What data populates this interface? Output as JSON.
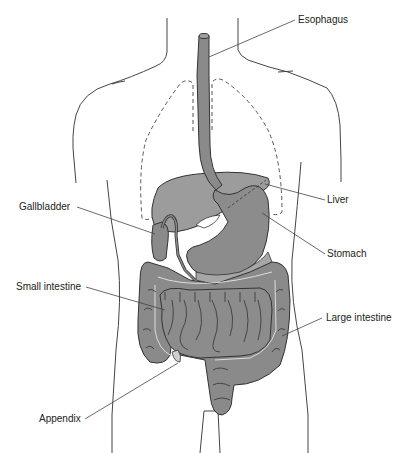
{
  "diagram": {
    "type": "anatomical-illustration",
    "colors": {
      "organ_fill": "#8a8a8a",
      "organ_fill_light": "#a6a6a6",
      "outline": "#333333",
      "leader_line": "#444444",
      "background": "#ffffff"
    },
    "labels": [
      {
        "id": "esophagus",
        "text": "Esophagus"
      },
      {
        "id": "liver",
        "text": "Liver"
      },
      {
        "id": "gallbladder",
        "text": "Gallbladder"
      },
      {
        "id": "stomach",
        "text": "Stomach"
      },
      {
        "id": "small-intestine",
        "text": "Small intestine"
      },
      {
        "id": "large-intestine",
        "text": "Large intestine"
      },
      {
        "id": "appendix",
        "text": "Appendix"
      }
    ]
  }
}
